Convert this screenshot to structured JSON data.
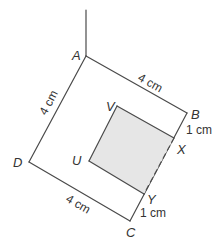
{
  "diagram": {
    "vertices": {
      "A": "A",
      "B": "B",
      "C": "C",
      "D": "D",
      "U": "U",
      "V": "V",
      "X": "X",
      "Y": "Y"
    },
    "measurements": {
      "AB": "4 cm",
      "AD": "4 cm",
      "DC": "4 cm",
      "BX": "1 cm",
      "YC": "1 cm"
    },
    "colors": {
      "stroke": "#4a4a4a",
      "shaded_region": "#e6e6e6",
      "text": "#333333"
    }
  }
}
